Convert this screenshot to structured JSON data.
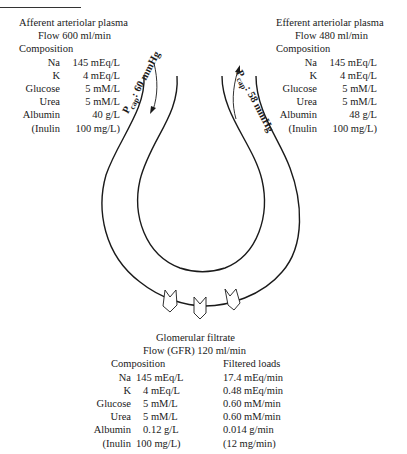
{
  "afferent": {
    "title": "Afferent arteriolar plasma",
    "flow": "Flow 600 ml/min",
    "composition_label": "Composition",
    "rows": [
      {
        "label": "Na",
        "value": "145 mEq/L"
      },
      {
        "label": "K",
        "value": "4 mEq/L"
      },
      {
        "label": "Glucose",
        "value": "5 mM/L"
      },
      {
        "label": "Urea",
        "value": "5 mM/L"
      },
      {
        "label": "Albumin",
        "value": "40 g/L"
      },
      {
        "label": "(Inulin",
        "value": "100 mg/L)"
      }
    ]
  },
  "efferent": {
    "title": "Efferent arteriolar plasma",
    "flow": "Flow 480 ml/min",
    "composition_label": "Composition",
    "rows": [
      {
        "label": "Na",
        "value": "145 mEq/L"
      },
      {
        "label": "K",
        "value": "4 mEq/L"
      },
      {
        "label": "Glucose",
        "value": "5 mM/L"
      },
      {
        "label": "Urea",
        "value": "5 mM/L"
      },
      {
        "label": "Albumin",
        "value": "48 g/L"
      },
      {
        "label": "(Inulin",
        "value": "100 mg/L)"
      }
    ]
  },
  "capillary": {
    "left_pressure": {
      "symbol": "P",
      "subscript": "cap",
      "value": ": 60 mmHg"
    },
    "right_pressure": {
      "symbol": "P",
      "subscript": "cap",
      "value": ": 58 mmHg"
    }
  },
  "filtrate": {
    "title": "Glomerular filtrate",
    "flow": "Flow (GFR) 120 ml/min",
    "composition_label": "Composition",
    "loads_label": "Filtered loads",
    "rows": [
      {
        "label": "Na",
        "value": "145 mEq/L",
        "load": "17.4 mEq/min"
      },
      {
        "label": "K",
        "value": "4 mEq/L",
        "load": "0.48 mEq/min"
      },
      {
        "label": "Glucose",
        "value": "5 mM/L",
        "load": "0.60 mM/min"
      },
      {
        "label": "Urea",
        "value": "5 mM/L",
        "load": "0.60 mM/min"
      },
      {
        "label": "Albumin",
        "value": "0.12 g/L",
        "load": "0.014 g/min"
      },
      {
        "label": "(Inulin",
        "value": "100 mg/L)",
        "load": "(12 mg/min)"
      }
    ]
  }
}
